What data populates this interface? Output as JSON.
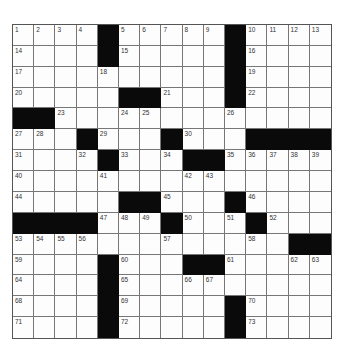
{
  "puzzle": {
    "type": "crossword",
    "rows": 15,
    "cols": 15,
    "layout": [
      "....#.....#....",
      "....#.....#....",
      "..........#....",
      ".....##...#....",
      "##.............",
      "...#...#...####",
      "....#...##.....",
      "...............",
      ".....##...#....",
      "####...#...#...",
      ".............##",
      "....#...##.....",
      "....#..........",
      "....#.....#....",
      "....#.....#...."
    ],
    "numbers": [
      [
        1,
        2,
        3,
        4,
        0,
        5,
        6,
        7,
        8,
        9,
        0,
        10,
        11,
        12,
        13
      ],
      [
        14,
        0,
        0,
        0,
        0,
        15,
        0,
        0,
        0,
        0,
        0,
        16,
        0,
        0,
        0
      ],
      [
        17,
        0,
        0,
        0,
        18,
        0,
        0,
        0,
        0,
        0,
        0,
        19,
        0,
        0,
        0
      ],
      [
        20,
        0,
        0,
        0,
        0,
        0,
        0,
        21,
        0,
        0,
        0,
        22,
        0,
        0,
        0
      ],
      [
        0,
        0,
        23,
        0,
        0,
        24,
        25,
        0,
        0,
        0,
        26,
        0,
        0,
        0,
        0
      ],
      [
        27,
        28,
        0,
        0,
        29,
        0,
        0,
        0,
        30,
        0,
        0,
        0,
        0,
        0,
        0
      ],
      [
        31,
        0,
        0,
        32,
        0,
        33,
        0,
        34,
        0,
        0,
        35,
        36,
        37,
        38,
        39
      ],
      [
        40,
        0,
        0,
        0,
        41,
        0,
        0,
        0,
        42,
        43,
        0,
        0,
        0,
        0,
        0
      ],
      [
        44,
        0,
        0,
        0,
        0,
        0,
        0,
        45,
        0,
        0,
        0,
        46,
        0,
        0,
        0
      ],
      [
        0,
        0,
        0,
        0,
        47,
        48,
        49,
        0,
        50,
        0,
        51,
        0,
        52,
        0,
        0
      ],
      [
        53,
        54,
        55,
        56,
        0,
        0,
        0,
        57,
        0,
        0,
        0,
        58,
        0,
        0,
        0
      ],
      [
        59,
        0,
        0,
        0,
        0,
        60,
        0,
        0,
        0,
        0,
        61,
        0,
        0,
        62,
        63
      ],
      [
        64,
        0,
        0,
        0,
        0,
        65,
        0,
        0,
        66,
        67,
        0,
        0,
        0,
        0,
        0
      ],
      [
        68,
        0,
        0,
        0,
        0,
        69,
        0,
        0,
        0,
        0,
        0,
        70,
        0,
        0,
        0
      ],
      [
        71,
        0,
        0,
        0,
        0,
        72,
        0,
        0,
        0,
        0,
        0,
        73,
        0,
        0,
        0
      ]
    ],
    "colors": {
      "block": "#0a0a0a",
      "cell": "#fdfdfd",
      "line": "#777777",
      "number": "#333333"
    }
  }
}
